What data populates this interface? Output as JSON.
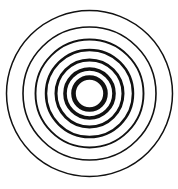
{
  "figure": {
    "background": "#ffffff",
    "stroke_color": "#111111",
    "center": {
      "x": 89.5,
      "y": 93.5
    },
    "rings": [
      {
        "r": 83,
        "stroke": 1.5
      },
      {
        "r": 66.5,
        "stroke": 1.6
      },
      {
        "r": 54,
        "stroke": 1.9
      },
      {
        "r": 43.5,
        "stroke": 2.5
      },
      {
        "r": 33.5,
        "stroke": 3.0
      },
      {
        "r": 24.5,
        "stroke": 3.6
      },
      {
        "r": 16,
        "stroke": 4.6
      }
    ]
  }
}
